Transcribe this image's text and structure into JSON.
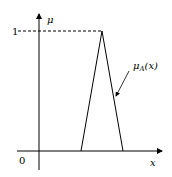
{
  "diagram": {
    "type": "triangular membership function",
    "y_axis_label": "μ",
    "x_axis_label": "x",
    "origin_label": "0",
    "max_label": "1",
    "curve_label_main": "μ",
    "curve_label_sub": "A",
    "curve_label_arg": "(x)",
    "triangle": {
      "left": 81,
      "peak": 102,
      "right": 123
    },
    "line_color": "#000000"
  }
}
